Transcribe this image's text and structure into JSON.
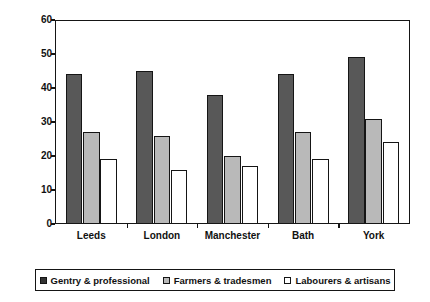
{
  "chart_data": {
    "type": "bar",
    "title": "",
    "xlabel": "",
    "ylabel": "Average age at death",
    "categories": [
      "Leeds",
      "London",
      "Manchester",
      "Bath",
      "York"
    ],
    "series": [
      {
        "name": "Gentry & professional",
        "color": "#585858",
        "values": [
          44,
          45,
          38,
          44,
          49
        ]
      },
      {
        "name": "Farmers & tradesmen",
        "color": "#b9b9b9",
        "values": [
          27,
          26,
          20,
          27,
          31
        ]
      },
      {
        "name": "Labourers & artisans",
        "color": "#ffffff",
        "values": [
          19,
          16,
          17,
          19,
          24
        ]
      }
    ],
    "ylim": [
      0,
      60
    ],
    "yticks": [
      0,
      10,
      20,
      30,
      40,
      50,
      60
    ],
    "ytick_labels": [
      "0",
      "10",
      "20",
      "30",
      "40",
      "50",
      "60"
    ],
    "grid": false,
    "legend_position": "bottom"
  }
}
